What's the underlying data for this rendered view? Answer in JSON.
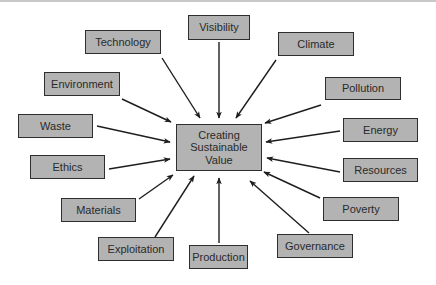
{
  "diagram": {
    "type": "hub-and-spoke",
    "center": {
      "label_lines": [
        "Creating",
        "Sustainable",
        "Value"
      ],
      "rect": [
        176,
        124,
        86,
        47
      ]
    },
    "nodes": [
      {
        "id": "technology",
        "label": "Technology",
        "rect": [
          85,
          30,
          76,
          24
        ],
        "arrow": [
          162,
          58,
          200,
          118
        ]
      },
      {
        "id": "visibility",
        "label": "Visibility",
        "rect": [
          188,
          15,
          62,
          25
        ],
        "arrow": [
          219,
          42,
          219,
          118
        ]
      },
      {
        "id": "climate",
        "label": "Climate",
        "rect": [
          278,
          32,
          76,
          24
        ],
        "arrow": [
          276,
          60,
          236,
          118
        ]
      },
      {
        "id": "environment",
        "label": "Environment",
        "rect": [
          44,
          72,
          76,
          24
        ],
        "arrow": [
          122,
          99,
          171,
          122
        ]
      },
      {
        "id": "pollution",
        "label": "Pollution",
        "rect": [
          325,
          77,
          76,
          23
        ],
        "arrow": [
          321,
          105,
          265,
          123
        ]
      },
      {
        "id": "waste",
        "label": "Waste",
        "rect": [
          18,
          114,
          75,
          24
        ],
        "arrow": [
          97,
          126,
          170,
          142
        ]
      },
      {
        "id": "energy",
        "label": "Energy",
        "rect": [
          343,
          118,
          75,
          24
        ],
        "arrow": [
          340,
          131,
          266,
          142
        ]
      },
      {
        "id": "ethics",
        "label": "Ethics",
        "rect": [
          30,
          155,
          75,
          24
        ],
        "arrow": [
          109,
          169,
          170,
          159
        ]
      },
      {
        "id": "resources",
        "label": "Resources",
        "rect": [
          343,
          158,
          75,
          24
        ],
        "arrow": [
          340,
          172,
          267,
          158
        ]
      },
      {
        "id": "materials",
        "label": "Materials",
        "rect": [
          61,
          198,
          75,
          24
        ],
        "arrow": [
          139,
          199,
          173,
          175
        ]
      },
      {
        "id": "poverty",
        "label": "Poverty",
        "rect": [
          323,
          197,
          76,
          24
        ],
        "arrow": [
          320,
          198,
          264,
          172
        ]
      },
      {
        "id": "exploitation",
        "label": "Exploitation",
        "rect": [
          98,
          237,
          76,
          24
        ],
        "arrow": [
          155,
          237,
          194,
          176
        ]
      },
      {
        "id": "production",
        "label": "Production",
        "rect": [
          189,
          245,
          59,
          24
        ],
        "arrow": [
          219,
          243,
          219,
          178
        ]
      },
      {
        "id": "governance",
        "label": "Governance",
        "rect": [
          277,
          234,
          76,
          24
        ],
        "arrow": [
          309,
          233,
          250,
          181
        ]
      }
    ],
    "colors": {
      "box_fill": "#b3b3b3",
      "box_border": "#2e2e2e",
      "text": "#2a2a2a",
      "arrow": "#1e1e1e",
      "background": "#ffffff"
    }
  }
}
